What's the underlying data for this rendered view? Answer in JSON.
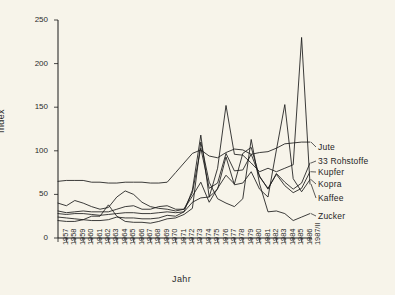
{
  "figure": {
    "background_color": "#f7f4ea",
    "ink_color": "#1a1a1a"
  },
  "chart_data": {
    "type": "line",
    "title": "",
    "subtitle": "",
    "xlabel": "Jahr",
    "ylabel": "Index",
    "xlim": [
      1957,
      1987.5
    ],
    "ylim": [
      0,
      250
    ],
    "yticks": [
      0,
      50,
      100,
      150,
      200,
      250
    ],
    "grid": false,
    "legend_position": "right-inline",
    "annotations": [],
    "categories": [
      "1957",
      "1958",
      "1959",
      "1960",
      "1961",
      "1962",
      "1963",
      "1964",
      "1965",
      "1966",
      "1967",
      "1968",
      "1969",
      "1970",
      "1971",
      "1972",
      "1973",
      "1974",
      "1975",
      "1976",
      "1977",
      "1978",
      "1979",
      "1980",
      "1981",
      "1982",
      "1983",
      "1984",
      "1985",
      "1986",
      "1987/II"
    ],
    "series": [
      {
        "name": "Jute",
        "values": [
          65,
          66,
          66,
          66,
          64,
          64,
          63,
          63,
          64,
          64,
          64,
          63,
          63,
          64,
          75,
          86,
          97,
          101,
          94,
          92,
          98,
          102,
          101,
          96,
          98,
          99,
          103,
          108,
          109,
          110,
          110
        ]
      },
      {
        "name": "33 Rohstoffe",
        "values": [
          40,
          37,
          43,
          40,
          36,
          33,
          35,
          47,
          54,
          50,
          41,
          36,
          34,
          33,
          31,
          33,
          52,
          103,
          57,
          63,
          97,
          77,
          78,
          96,
          71,
          56,
          74,
          64,
          56,
          63,
          86
        ]
      },
      {
        "name": "Kupfer",
        "values": [
          31,
          29,
          30,
          31,
          30,
          30,
          30,
          33,
          36,
          37,
          33,
          33,
          36,
          37,
          33,
          33,
          48,
          64,
          41,
          57,
          72,
          62,
          97,
          104,
          70,
          57,
          73,
          60,
          52,
          57,
          76
        ]
      },
      {
        "name": "Kopra",
        "values": [
          28,
          27,
          28,
          28,
          27,
          26,
          27,
          28,
          29,
          29,
          28,
          28,
          29,
          30,
          29,
          30,
          55,
          118,
          47,
          56,
          93,
          61,
          63,
          76,
          56,
          47,
          101,
          153,
          68,
          53,
          67
        ]
      },
      {
        "name": "Kaffee",
        "values": [
          24,
          23,
          22,
          21,
          20,
          20,
          21,
          24,
          23,
          23,
          22,
          22,
          23,
          26,
          25,
          30,
          41,
          46,
          47,
          80,
          152,
          96,
          95,
          86,
          76,
          80,
          76,
          80,
          84,
          230,
          62
        ]
      },
      {
        "name": "Zucker",
        "values": [
          20,
          19,
          19,
          21,
          25,
          25,
          38,
          25,
          19,
          18,
          18,
          17,
          19,
          22,
          23,
          27,
          34,
          110,
          64,
          45,
          40,
          36,
          45,
          113,
          62,
          30,
          31,
          28,
          20,
          24,
          28
        ]
      }
    ]
  },
  "legend": {
    "items": [
      {
        "label": "Jute"
      },
      {
        "label": "33 Rohstoffe"
      },
      {
        "label": "Kupfer"
      },
      {
        "label": "Kopra"
      },
      {
        "label": "Kaffee"
      },
      {
        "label": "Zucker"
      }
    ]
  }
}
